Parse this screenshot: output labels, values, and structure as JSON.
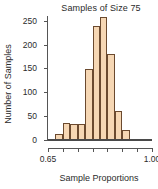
{
  "chart_data": {
    "type": "bar",
    "title": "Samples of Size 75",
    "xlabel": "Sample Proportions",
    "ylabel": "Number of Samples",
    "grid": false,
    "legend": null,
    "xlim": [
      0.65,
      1.0
    ],
    "ylim": [
      0,
      260
    ],
    "bin_width": 0.025,
    "bin_starts": [
      0.675,
      0.7,
      0.725,
      0.75,
      0.775,
      0.8,
      0.825,
      0.85,
      0.875,
      0.9
    ],
    "categories": [
      "0.675",
      "0.700",
      "0.725",
      "0.750",
      "0.775",
      "0.800",
      "0.825",
      "0.850",
      "0.875",
      "0.900"
    ],
    "values": [
      12,
      35,
      33,
      33,
      148,
      240,
      257,
      180,
      60,
      20
    ],
    "xticks": [
      0.65,
      0.7,
      0.75,
      0.8,
      0.85,
      0.9,
      0.95,
      1.0
    ],
    "xtick_labels": [
      "0.65",
      "",
      "",
      "",
      "",
      "",
      "",
      "1.00"
    ],
    "yticks": [
      0,
      50,
      100,
      150,
      200,
      250
    ],
    "ytick_labels": [
      "0",
      "50",
      "100",
      "150",
      "200",
      "250"
    ],
    "bar_fill": "#f6d7b4",
    "bar_stroke": "#6b4a2f",
    "axis_color": "#555555",
    "text_color": "#2b2b2b",
    "background": "#ffffff"
  }
}
